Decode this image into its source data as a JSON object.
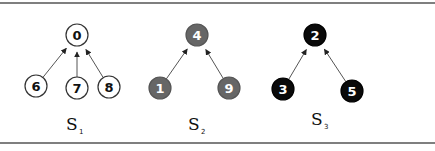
{
  "sets": [
    {
      "label": "S",
      "subscript": "1",
      "style": "white",
      "root": {
        "value": "0",
        "x": 77,
        "y": 35
      },
      "children": [
        {
          "value": "6",
          "x": 36,
          "y": 86
        },
        {
          "value": "7",
          "x": 77,
          "y": 88
        },
        {
          "value": "8",
          "x": 109,
          "y": 87
        }
      ],
      "label_pos": {
        "x": 66,
        "y": 130
      }
    },
    {
      "label": "S",
      "subscript": "2",
      "style": "gray",
      "root": {
        "value": "4",
        "x": 197,
        "y": 35
      },
      "children": [
        {
          "value": "1",
          "x": 160,
          "y": 88
        },
        {
          "value": "9",
          "x": 229,
          "y": 88
        }
      ],
      "label_pos": {
        "x": 188,
        "y": 130
      }
    },
    {
      "label": "S",
      "subscript": "3",
      "style": "black",
      "root": {
        "value": "2",
        "x": 315,
        "y": 35
      },
      "children": [
        {
          "value": "3",
          "x": 283,
          "y": 89
        },
        {
          "value": "5",
          "x": 352,
          "y": 91
        }
      ],
      "label_pos": {
        "x": 311,
        "y": 125
      }
    }
  ],
  "colors": {
    "white": {
      "fill": "#ffffff",
      "stroke": "#333333",
      "text": "#111111"
    },
    "gray": {
      "fill": "#666666",
      "stroke": "#555555",
      "text": "#ffffff"
    },
    "black": {
      "fill": "#0a0a0a",
      "stroke": "#000000",
      "text": "#ffffff"
    },
    "edge": "#555555",
    "frame": "#555555"
  }
}
